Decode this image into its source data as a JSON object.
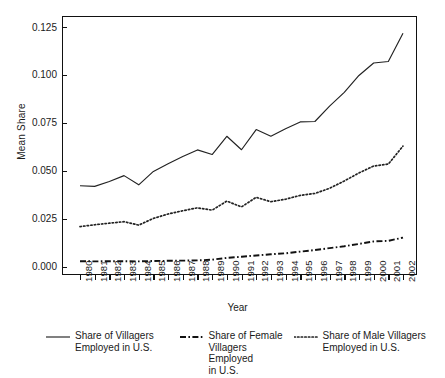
{
  "chart_data": {
    "type": "line",
    "title": "",
    "xlabel": "Year",
    "ylabel": "Mean Share",
    "grid": false,
    "legend_position": "below-axes",
    "xlim": [
      1980,
      2002
    ],
    "ylim": [
      -0.004,
      0.131
    ],
    "yticks": [
      0.0,
      0.025,
      0.05,
      0.075,
      0.1,
      0.125
    ],
    "ytick_labels": [
      "0.000",
      "0.025",
      "0.050",
      "0.075",
      "0.100",
      "0.125"
    ],
    "x": [
      1980,
      1981,
      1982,
      1983,
      1984,
      1985,
      1986,
      1987,
      1988,
      1989,
      1990,
      1991,
      1992,
      1993,
      1994,
      1995,
      1996,
      1997,
      1998,
      1999,
      2000,
      2001,
      2002
    ],
    "xtick_labels": [
      "1980",
      "1981",
      "1982",
      "1983",
      "1984",
      "1985",
      "1986",
      "1987",
      "1988",
      "1989",
      "1990",
      "1991",
      "1992",
      "1993",
      "1994",
      "1995",
      "1996",
      "1997",
      "1998",
      "1999",
      "2000",
      "2001",
      "2002"
    ],
    "series": [
      {
        "name": "Share of Villagers Employed in U.S.",
        "style": "solid",
        "color": "#222222",
        "values": [
          0.0425,
          0.0422,
          0.0447,
          0.0478,
          0.043,
          0.05,
          0.054,
          0.0578,
          0.0612,
          0.0588,
          0.0683,
          0.0613,
          0.0718,
          0.0683,
          0.0722,
          0.0758,
          0.076,
          0.084,
          0.0912,
          0.1,
          0.1065,
          0.1073,
          0.122
        ]
      },
      {
        "name": "Share of Female Villagers Employed in U.S.",
        "style": "dashdot",
        "color": "#111111",
        "values": [
          0.0032,
          0.0031,
          0.0032,
          0.0032,
          0.0031,
          0.0033,
          0.0034,
          0.0035,
          0.0036,
          0.004,
          0.0049,
          0.0055,
          0.0062,
          0.0068,
          0.0073,
          0.0082,
          0.009,
          0.01,
          0.011,
          0.0122,
          0.0135,
          0.0138,
          0.0155
        ]
      },
      {
        "name": "Share of Male Villagers Employed in U.S.",
        "style": "dotted",
        "color": "#222222",
        "values": [
          0.0212,
          0.0222,
          0.023,
          0.0238,
          0.022,
          0.0255,
          0.0278,
          0.0295,
          0.031,
          0.0298,
          0.0345,
          0.0315,
          0.0365,
          0.0342,
          0.0355,
          0.0375,
          0.0385,
          0.0412,
          0.045,
          0.0492,
          0.0528,
          0.0538,
          0.0632
        ]
      }
    ]
  },
  "legend": {
    "items": [
      {
        "label": "Share of Villagers\nEmployed in U.S.",
        "style": "solid"
      },
      {
        "label": "Share of Female\nVillagers Employed\nin U.S.",
        "style": "dashdot"
      },
      {
        "label": "Share of Male Villagers\nEmployed in U.S.",
        "style": "dotted"
      }
    ]
  }
}
